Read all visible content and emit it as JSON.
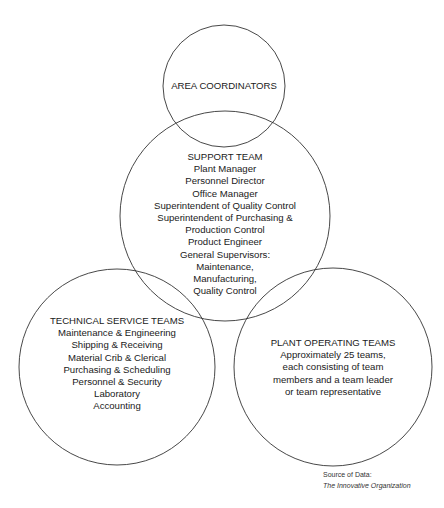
{
  "diagram": {
    "colors": {
      "stroke": "#333333",
      "text": "#1a1a1a",
      "background": "#ffffff"
    },
    "circles": {
      "area_coordinators": {
        "title": "AREA COORDINATORS",
        "items": []
      },
      "support_team": {
        "title": "SUPPORT TEAM",
        "items": [
          "Plant Manager",
          "Personnel Director",
          "Office Manager",
          "Superintendent of Quality Control",
          "Superintendent of Purchasing &",
          "Production Control",
          "Product Engineer",
          "General Supervisors:",
          "Maintenance,",
          "Manufacturing,",
          "Quality Control"
        ]
      },
      "technical_service_teams": {
        "title": "TECHNICAL SERVICE TEAMS",
        "items": [
          "Maintenance & Engineering",
          "Shipping & Receiving",
          "Material Crib & Clerical",
          "Purchasing & Scheduling",
          "Personnel & Security",
          "Laboratory",
          "Accounting"
        ]
      },
      "plant_operating_teams": {
        "title": "PLANT OPERATING TEAMS",
        "items": [
          "Approximately 25 teams,",
          "each consisting of team",
          "members and a team leader",
          "or team representative"
        ]
      }
    },
    "source": {
      "label": "Source of Data:",
      "title": "The Innovative Organization"
    }
  }
}
